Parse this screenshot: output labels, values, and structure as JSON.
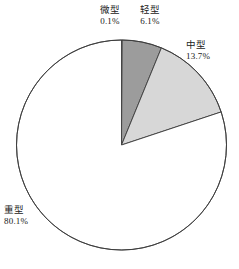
{
  "chart_data": {
    "type": "pie",
    "title": "",
    "subtitle": "",
    "xlabel": "",
    "ylabel": "",
    "legend_position": "none",
    "grid": false,
    "start_angle_deg": 0,
    "direction": "clockwise",
    "unit": "%",
    "categories": [
      "微型",
      "轻型",
      "中型",
      "重型"
    ],
    "values": [
      0.1,
      6.1,
      13.7,
      80.1
    ],
    "slices": [
      {
        "name": "slice-weixing",
        "label": "微型",
        "value": 0.1,
        "value_text": "0.1%",
        "color": "#8f8f8f",
        "stroke": "#3b3b3b"
      },
      {
        "name": "slice-qingxing",
        "label": "轻型",
        "value": 6.1,
        "value_text": "6.1%",
        "color": "#9c9c9c",
        "stroke": "#3b3b3b"
      },
      {
        "name": "slice-zhongxing",
        "label": "中型",
        "value": 13.7,
        "value_text": "13.7%",
        "color": "#d7d7d7",
        "stroke": "#3b3b3b"
      },
      {
        "name": "slice-zhongxing-heavy",
        "label": "重型",
        "value": 80.1,
        "value_text": "80.1%",
        "color": "#ffffff",
        "stroke": "#3b3b3b"
      }
    ]
  },
  "labels": {
    "weixing": {
      "category": "微型",
      "percent": "0.1%"
    },
    "qingxing": {
      "category": "轻型",
      "percent": "6.1%"
    },
    "zhongxing": {
      "category": "中型",
      "percent": "13.7%"
    },
    "zhongxing_heavy": {
      "category": "重型",
      "percent": "80.1%"
    }
  },
  "caption": {
    "text": ""
  },
  "geometry": {
    "center_x": 121.5,
    "center_y": 145,
    "radius": 105
  },
  "colors": {
    "outline": "#3b3b3b",
    "background": "#ffffff",
    "text": "#1a1a1a"
  }
}
